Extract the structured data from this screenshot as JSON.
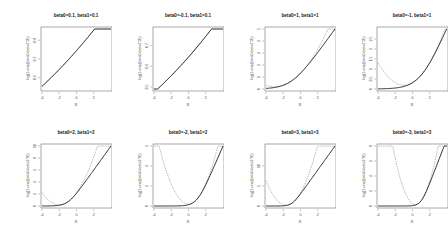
{
  "figure": {
    "xlabel": "X",
    "ylabel": "log(1+exp(beta0+beta1*X))",
    "colors": {
      "exact": "#000000",
      "approx": "#999999",
      "box": "#555555"
    }
  },
  "chart_data": [
    {
      "type": "line",
      "title": "beta0=0.1, beta1=0.1",
      "xlabel": "X",
      "ylabel": "log(1+exp(beta0+beta1*X))",
      "beta0": 0.1,
      "beta1": 0.1,
      "xlim": [
        -4,
        4
      ],
      "ylim": [
        0.54,
        0.86
      ],
      "yticks": [
        0.6,
        0.7,
        0.8
      ],
      "xticks": [
        -4,
        -2,
        0,
        2
      ],
      "series": [
        {
          "name": "exact",
          "style": "solid"
        },
        {
          "name": "approx",
          "style": "dashed"
        }
      ]
    },
    {
      "type": "line",
      "title": "beta0=-0.1, beta1=0.1",
      "xlabel": "X",
      "ylabel": "log(1+exp(beta0+beta1*X))",
      "beta0": -0.1,
      "beta1": 0.1,
      "xlim": [
        -4,
        4
      ],
      "ylim": [
        0.49,
        0.78
      ],
      "yticks": [
        0.5,
        0.6,
        0.7
      ],
      "xticks": [
        -4,
        -2,
        0,
        2
      ],
      "series": [
        {
          "name": "exact",
          "style": "solid"
        },
        {
          "name": "approx",
          "style": "dashed"
        }
      ]
    },
    {
      "type": "line",
      "title": "beta0=1, beta1=1",
      "xlabel": "X",
      "ylabel": "log(1+exp(beta0+beta1*X))",
      "beta0": 1,
      "beta1": 1,
      "xlim": [
        -4,
        4
      ],
      "ylim": [
        0,
        5
      ],
      "yticks": [
        0,
        1,
        2,
        3,
        4,
        5
      ],
      "xticks": [
        -4,
        -2,
        0,
        2
      ],
      "series": [
        {
          "name": "exact",
          "style": "solid"
        },
        {
          "name": "approx",
          "style": "dashed"
        }
      ]
    },
    {
      "type": "line",
      "title": "beta0=-1, beta1=1",
      "xlabel": "X",
      "ylabel": "log(1+exp(beta0+beta1*X))",
      "beta0": -1,
      "beta1": 1,
      "xlim": [
        -4,
        4
      ],
      "ylim": [
        0,
        3
      ],
      "yticks": [
        0,
        0.5,
        1,
        1.5,
        2,
        2.5
      ],
      "xticks": [
        -4,
        -2,
        0,
        2
      ],
      "series": [
        {
          "name": "exact",
          "style": "solid"
        },
        {
          "name": "approx",
          "style": "dashed"
        }
      ]
    },
    {
      "type": "line",
      "title": "beta0=2, beta1=2",
      "xlabel": "X",
      "ylabel": "log(1+exp(beta0+beta1*X))",
      "beta0": 2,
      "beta1": 2,
      "xlim": [
        -4,
        4
      ],
      "ylim": [
        0,
        10
      ],
      "yticks": [
        0,
        2,
        4,
        6,
        8,
        10
      ],
      "xticks": [
        -4,
        -2,
        0,
        2
      ],
      "series": [
        {
          "name": "exact",
          "style": "solid"
        },
        {
          "name": "approx",
          "style": "dashed"
        }
      ]
    },
    {
      "type": "line",
      "title": "beta0=-2, beta1=2",
      "xlabel": "X",
      "ylabel": "log(1+exp(beta0+beta1*X))",
      "beta0": -2,
      "beta1": 2,
      "xlim": [
        -4,
        4
      ],
      "ylim": [
        0,
        6
      ],
      "yticks": [
        0,
        2,
        4,
        6
      ],
      "xticks": [
        -4,
        -2,
        0,
        2
      ],
      "series": [
        {
          "name": "exact",
          "style": "solid"
        },
        {
          "name": "approx",
          "style": "dashed"
        }
      ]
    },
    {
      "type": "line",
      "title": "beta0=3, beta1=3",
      "xlabel": "X",
      "ylabel": "log(1+exp(beta0+beta1*X))",
      "beta0": 3,
      "beta1": 3,
      "xlim": [
        -4,
        4
      ],
      "ylim": [
        0,
        15
      ],
      "yticks": [
        0,
        5,
        10
      ],
      "xticks": [
        -4,
        -2,
        0,
        2
      ],
      "series": [
        {
          "name": "exact",
          "style": "solid"
        },
        {
          "name": "approx",
          "style": "dashed"
        }
      ]
    },
    {
      "type": "line",
      "title": "beta0=-3, beta1=3",
      "xlabel": "X",
      "ylabel": "log(1+exp(beta0+beta1*X))",
      "beta0": -3,
      "beta1": 3,
      "xlim": [
        -4,
        4
      ],
      "ylim": [
        0,
        8
      ],
      "yticks": [
        0,
        2,
        4,
        6,
        8
      ],
      "xticks": [
        -4,
        -2,
        0,
        2
      ],
      "series": [
        {
          "name": "exact",
          "style": "solid"
        },
        {
          "name": "approx",
          "style": "dashed"
        }
      ]
    }
  ]
}
